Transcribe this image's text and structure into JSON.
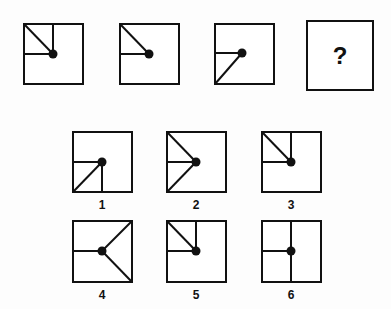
{
  "puzzle": {
    "sequence": [
      {
        "id": "seq-1",
        "lines": [
          "up",
          "left",
          "up-left"
        ]
      },
      {
        "id": "seq-2",
        "lines": [
          "left",
          "up-left"
        ]
      },
      {
        "id": "seq-3",
        "lines": [
          "left",
          "down-left"
        ]
      }
    ],
    "question": {
      "symbol": "?"
    },
    "options": [
      {
        "label": "1",
        "lines": [
          "left",
          "down",
          "down-left"
        ]
      },
      {
        "label": "2",
        "lines": [
          "up-left",
          "left",
          "down-left"
        ]
      },
      {
        "label": "3",
        "lines": [
          "up",
          "left",
          "up-left"
        ]
      },
      {
        "label": "4",
        "lines": [
          "left",
          "up-right",
          "down-right"
        ]
      },
      {
        "label": "5",
        "lines": [
          "up",
          "left",
          "up-left"
        ]
      },
      {
        "label": "6",
        "lines": [
          "up",
          "down",
          "left"
        ]
      }
    ]
  }
}
